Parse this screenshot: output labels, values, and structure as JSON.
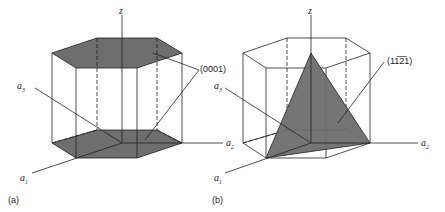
{
  "panels": [
    {
      "id": "a",
      "caption": "(a)",
      "plane_label": "(0001)",
      "axes": {
        "z": "z",
        "a1": "a",
        "a1_sub": "1",
        "a2": "a",
        "a2_sub": "2",
        "a3": "a",
        "a3_sub": "3"
      }
    },
    {
      "id": "b",
      "caption": "(b)",
      "plane_label": "(11̅2̅1)",
      "plane_label_display": "(1121)",
      "axes": {
        "z": "z",
        "a1": "a",
        "a1_sub": "1",
        "a2": "a",
        "a2_sub": "2",
        "a3": "a",
        "a3_sub": "3"
      }
    }
  ],
  "colors": {
    "plane_fill": "#6e6e6e",
    "line": "#222222"
  }
}
